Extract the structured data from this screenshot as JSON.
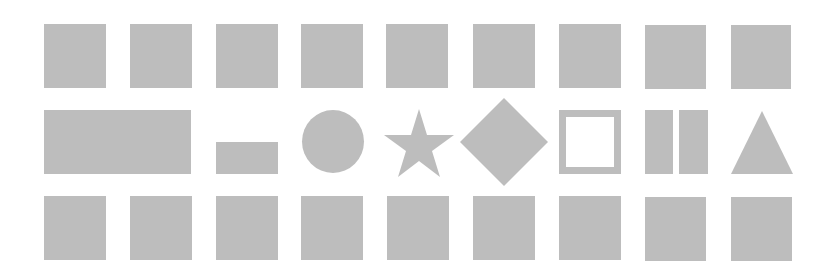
{
  "canvas": {
    "width": 832,
    "height": 270,
    "background": "#ffffff"
  },
  "colors": {
    "shape_fill": "#bdbdbd"
  },
  "rows": [
    {
      "name": "top-row",
      "shapes": [
        "square",
        "square",
        "square",
        "square",
        "square",
        "square",
        "square",
        "square",
        "square"
      ]
    },
    {
      "name": "middle-row",
      "shapes": [
        "wide-rectangle",
        "small-rectangle",
        "circle",
        "star",
        "diamond",
        "outline-square",
        "double-bar",
        "triangle"
      ]
    },
    {
      "name": "bottom-row",
      "shapes": [
        "square",
        "square",
        "square",
        "square",
        "square",
        "square",
        "square",
        "square",
        "square"
      ]
    }
  ]
}
